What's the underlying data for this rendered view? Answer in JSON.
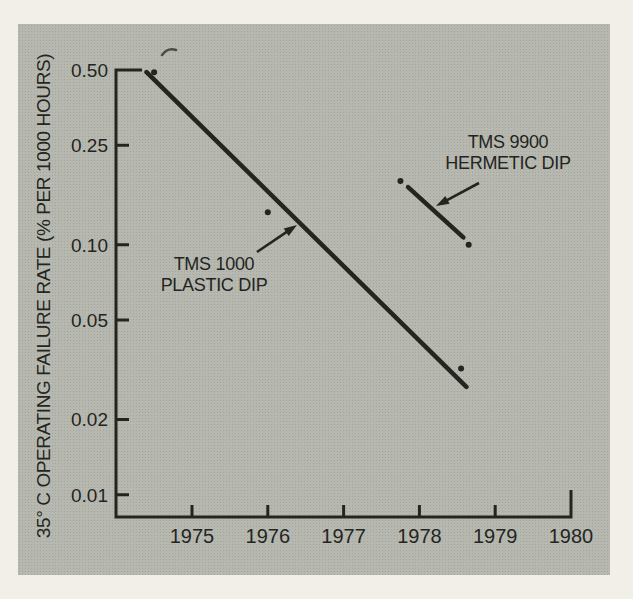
{
  "figure": {
    "background_color": "#b6b8b0",
    "page_color": "#f1efe8",
    "ink_color": "#24251f"
  },
  "chart_data": {
    "type": "scatter",
    "title": "",
    "xlabel": "",
    "ylabel": "35° C OPERATING FAILURE RATE (% PER 1000 HOURS)",
    "y_scale": "log",
    "grid": false,
    "xlim": [
      1974.0,
      1980.0
    ],
    "ylim": [
      0.008,
      0.5
    ],
    "x_ticks": [
      "1975",
      "1976",
      "1977",
      "1978",
      "1979",
      "1980"
    ],
    "y_ticks": [
      {
        "value": 0.5,
        "label": "0.50"
      },
      {
        "value": 0.25,
        "label": "0.25"
      },
      {
        "value": 0.1,
        "label": "0.10"
      },
      {
        "value": 0.05,
        "label": "0.05"
      },
      {
        "value": 0.02,
        "label": "0.02"
      },
      {
        "value": 0.01,
        "label": "0.01"
      }
    ],
    "series": [
      {
        "name": "TMS 1000 PLASTIC DIP",
        "points_x": [
          1974.5,
          1976.0,
          1978.55
        ],
        "points_y": [
          0.49,
          0.135,
          0.032
        ],
        "line_x": [
          1974.4,
          1978.62
        ],
        "line_y": [
          0.49,
          0.027
        ]
      },
      {
        "name": "TMS 9900 HERMETIC DIP",
        "points_x": [
          1977.75,
          1978.65
        ],
        "points_y": [
          0.18,
          0.1
        ],
        "line_x": [
          1977.85,
          1978.58
        ],
        "line_y": [
          0.17,
          0.107
        ]
      }
    ],
    "annotations": [
      {
        "id": "tms-1000",
        "lines": [
          "TMS 1000",
          "PLASTIC DIP"
        ],
        "arrow_from_px": [
          257,
          252
        ],
        "arrow_to_px": [
          297,
          225
        ]
      },
      {
        "id": "tms-9900",
        "lines": [
          "TMS 9900",
          "HERMETIC DIP"
        ],
        "arrow_from_px": [
          479,
          183
        ],
        "arrow_to_px": [
          436,
          206
        ]
      }
    ]
  }
}
